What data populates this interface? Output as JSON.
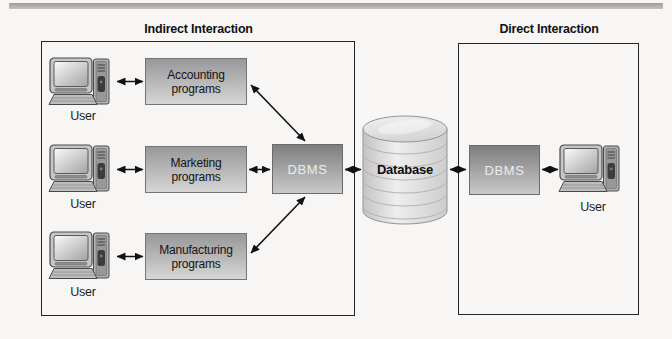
{
  "figure": {
    "indirect_section": {
      "title": "Indirect Interaction",
      "rows": [
        {
          "user_label": "User",
          "program_label": "Accounting programs"
        },
        {
          "user_label": "User",
          "program_label": "Marketing programs"
        },
        {
          "user_label": "User",
          "program_label": "Manufacturing programs"
        }
      ],
      "dbms_label": "DBMS"
    },
    "database_label": "Database",
    "direct_section": {
      "title": "Direct Interaction",
      "dbms_label": "DBMS",
      "user_label": "User"
    },
    "icons": {
      "user_computer": "desktop-computer-icon",
      "database": "database-cylinder-icon",
      "arrows": "double-headed-arrow"
    },
    "colors": {
      "background": "#f7f6f4",
      "top_rule": "#a6a4a2",
      "group_box_border": "#242424",
      "program_box_top": "#98989a",
      "program_box_bottom": "#d6d6d6",
      "dbms_box_top": "#7e7e80",
      "dbms_box_bottom": "#c9c9c9",
      "dbms_text": "#ececec",
      "cylinder_fill": "#dcdcdc",
      "arrow": "#111111"
    }
  }
}
